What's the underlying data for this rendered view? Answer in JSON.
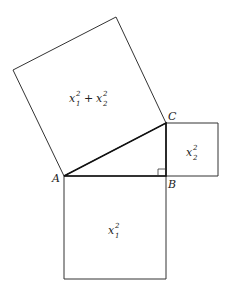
{
  "diagram": {
    "vertices": {
      "A": "A",
      "B": "B",
      "C": "C"
    },
    "squares": {
      "hypotenuse": {
        "base": "x",
        "sub1": "1",
        "sup1": "2",
        "plus": "+",
        "sub2": "2",
        "sup2": "2"
      },
      "leg_ab": {
        "base": "x",
        "sub": "1",
        "sup": "2"
      },
      "leg_bc": {
        "base": "x",
        "sub": "2",
        "sup": "2"
      }
    },
    "line_color": "#222222"
  }
}
